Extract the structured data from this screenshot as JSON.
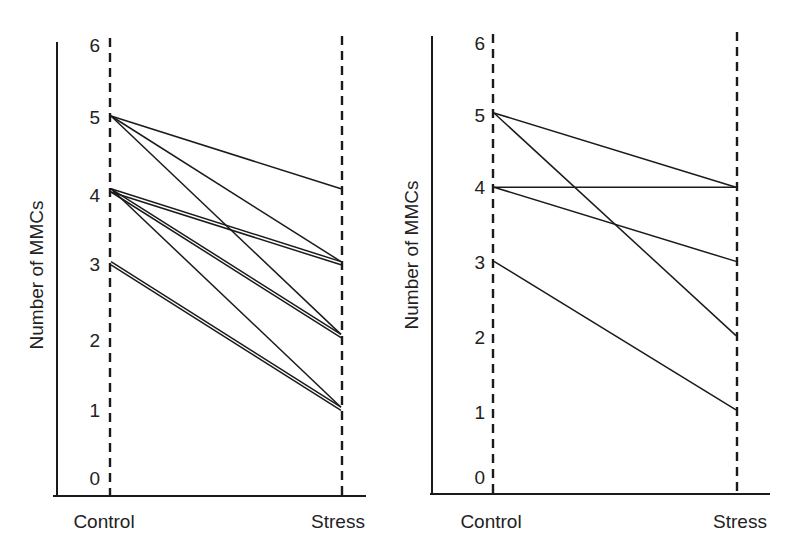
{
  "chart_data": [
    {
      "type": "line",
      "title": "",
      "xlabel": "",
      "ylabel": "Number of MMCs",
      "categories": [
        "Control",
        "Stress"
      ],
      "yticks": [
        0,
        1,
        2,
        3,
        4,
        5,
        6
      ],
      "ylim": [
        0,
        6
      ],
      "grid": false,
      "legend": null,
      "series": [
        {
          "name": "subject-1",
          "values": [
            5,
            4
          ]
        },
        {
          "name": "subject-2",
          "values": [
            5,
            3
          ]
        },
        {
          "name": "subject-3",
          "values": [
            5,
            2
          ]
        },
        {
          "name": "subject-4",
          "values": [
            4,
            3
          ]
        },
        {
          "name": "subject-5",
          "values": [
            4,
            3
          ]
        },
        {
          "name": "subject-6",
          "values": [
            4,
            2
          ]
        },
        {
          "name": "subject-7",
          "values": [
            4,
            2
          ]
        },
        {
          "name": "subject-8",
          "values": [
            4,
            1
          ]
        },
        {
          "name": "subject-9",
          "values": [
            3,
            1
          ]
        },
        {
          "name": "subject-10",
          "values": [
            3,
            1
          ]
        }
      ]
    },
    {
      "type": "line",
      "title": "",
      "xlabel": "",
      "ylabel": "Number of MMCs",
      "categories": [
        "Control",
        "Stress"
      ],
      "yticks": [
        0,
        1,
        2,
        3,
        4,
        5,
        6
      ],
      "ylim": [
        0,
        6
      ],
      "grid": false,
      "legend": null,
      "series": [
        {
          "name": "subject-1",
          "values": [
            5,
            4
          ]
        },
        {
          "name": "subject-2",
          "values": [
            5,
            2
          ]
        },
        {
          "name": "subject-3",
          "values": [
            4,
            4
          ]
        },
        {
          "name": "subject-4",
          "values": [
            4,
            3
          ]
        },
        {
          "name": "subject-5",
          "values": [
            3,
            1
          ]
        }
      ]
    }
  ],
  "panels": [
    {
      "ylabel": "Number of MMCs",
      "yticks": [
        "0",
        "1",
        "2",
        "3",
        "4",
        "5",
        "6"
      ],
      "categories": [
        "Control",
        "Stress"
      ]
    },
    {
      "ylabel": "Number of MMCs",
      "yticks": [
        "0",
        "1",
        "2",
        "3",
        "4",
        "5",
        "6"
      ],
      "categories": [
        "Control",
        "Stress"
      ]
    }
  ],
  "colors": {
    "line": "#1a1a1a",
    "background": "#ffffff"
  }
}
